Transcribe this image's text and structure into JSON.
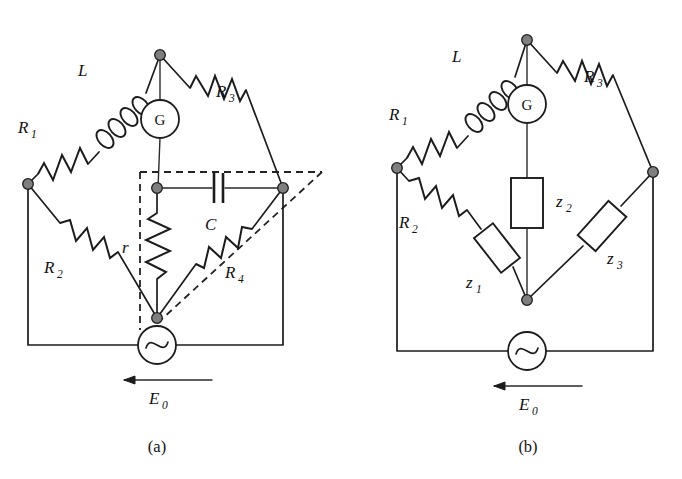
{
  "figure": {
    "kind": "circuit-diagram",
    "background_color": "#ffffff",
    "line_color": "#1c1c1c",
    "node_color": "#7f7f7f",
    "top_bleed_text": "",
    "panels": [
      {
        "id": "a",
        "caption": "(a)",
        "source_label": "E",
        "source_sub": "0",
        "meter_label": "G",
        "components": [
          {
            "name": "R1",
            "label": "R",
            "sub": "1",
            "type": "resistor"
          },
          {
            "name": "L",
            "label": "L",
            "sub": "",
            "type": "inductor"
          },
          {
            "name": "R3",
            "label": "R",
            "sub": "3",
            "type": "resistor"
          },
          {
            "name": "R2",
            "label": "R",
            "sub": "2",
            "type": "resistor"
          },
          {
            "name": "r",
            "label": "r",
            "sub": "",
            "type": "resistor"
          },
          {
            "name": "C",
            "label": "C",
            "sub": "",
            "type": "capacitor"
          },
          {
            "name": "R4",
            "label": "R",
            "sub": "4",
            "type": "resistor"
          }
        ]
      },
      {
        "id": "b",
        "caption": "(b)",
        "source_label": "E",
        "source_sub": "0",
        "meter_label": "G",
        "components": [
          {
            "name": "R1",
            "label": "R",
            "sub": "1",
            "type": "resistor"
          },
          {
            "name": "L",
            "label": "L",
            "sub": "",
            "type": "inductor"
          },
          {
            "name": "R3",
            "label": "R",
            "sub": "3",
            "type": "resistor"
          },
          {
            "name": "R2",
            "label": "R",
            "sub": "2",
            "type": "resistor"
          },
          {
            "name": "z1",
            "label": "z",
            "sub": "1",
            "type": "impedance-box"
          },
          {
            "name": "z2",
            "label": "z",
            "sub": "2",
            "type": "impedance-box"
          },
          {
            "name": "z3",
            "label": "z",
            "sub": "3",
            "type": "impedance-box"
          }
        ]
      }
    ]
  },
  "labels": {
    "a": {
      "R1": "R",
      "R1_sub": "1",
      "L": "L",
      "R3": "R",
      "R3_sub": "3",
      "R2": "R",
      "R2_sub": "2",
      "r": "r",
      "C": "C",
      "R4": "R",
      "R4_sub": "4",
      "G": "G",
      "E0": "E",
      "E0_sub": "0",
      "caption": "(a)"
    },
    "b": {
      "R1": "R",
      "R1_sub": "1",
      "L": "L",
      "R3": "R",
      "R3_sub": "3",
      "R2": "R",
      "R2_sub": "2",
      "z1": "z",
      "z1_sub": "1",
      "z2": "z",
      "z2_sub": "2",
      "z3": "z",
      "z3_sub": "3",
      "G": "G",
      "E0": "E",
      "E0_sub": "0",
      "caption": "(b)"
    }
  }
}
